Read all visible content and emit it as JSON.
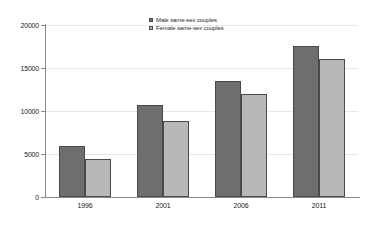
{
  "chart_data": {
    "type": "bar",
    "title": "",
    "subtitle": "",
    "xlabel": "",
    "ylabel": "",
    "categories": [
      "1996",
      "2001",
      "2006",
      "2011"
    ],
    "series": [
      {
        "name": "Male same-sex couples",
        "color": "#6e6e6e",
        "values": [
          5900,
          10700,
          13500,
          17600
        ]
      },
      {
        "name": "Female same-sex couples",
        "color": "#b8b8b8",
        "values": [
          4400,
          8800,
          12000,
          16100
        ]
      }
    ],
    "ylim": [
      0,
      20000
    ],
    "y_ticks": [
      0,
      5000,
      10000,
      15000,
      20000
    ],
    "y_tick_labels": [
      "0",
      "5000",
      "10000",
      "15000",
      "20000"
    ],
    "grid": true,
    "grid_axis": "y",
    "legend_position": "top-center",
    "annotations": []
  },
  "legend": {
    "entries": [
      {
        "label": "Male same-sex couples",
        "swatch": "male-swatch"
      },
      {
        "label": "Female same-sex couples",
        "swatch": "female-swatch"
      }
    ]
  },
  "watermark": {
    "lines": [
      "",
      "",
      "",
      ""
    ]
  }
}
